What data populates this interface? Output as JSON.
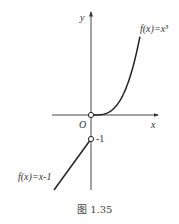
{
  "figure": {
    "caption": "图 1.35",
    "axes": {
      "x_label": "x",
      "y_label": "y",
      "origin_label": "O"
    },
    "point_labels": {
      "minus_one": "-1"
    },
    "functions": [
      {
        "label": "f(x)=x³",
        "expression": "x^3",
        "domain": "x >= 0",
        "open_endpoint": [
          0,
          0
        ]
      },
      {
        "label": "f(x)=x-1",
        "expression": "x-1",
        "domain": "x < 0",
        "open_endpoint": [
          0,
          -1
        ]
      }
    ]
  }
}
